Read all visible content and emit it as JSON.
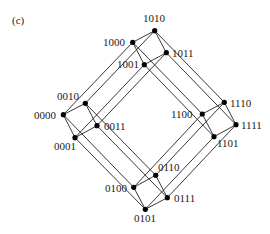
{
  "figure": {
    "panel_label": "(c)",
    "panel_label_pos": [
      12,
      24
    ],
    "node_radius": 2.6,
    "nodes": [
      {
        "id": "0000",
        "x": 63.3,
        "y": 114.7,
        "lx": 34,
        "ly": 119,
        "anchor": "start"
      },
      {
        "id": "0010",
        "x": 85.3,
        "y": 103.3,
        "lx": 57,
        "ly": 100,
        "anchor": "start"
      },
      {
        "id": "0001",
        "x": 75.0,
        "y": 137.7,
        "lx": 54,
        "ly": 150,
        "anchor": "start"
      },
      {
        "id": "0011",
        "x": 97.0,
        "y": 125.7,
        "lx": 104,
        "ly": 130,
        "anchor": "start"
      },
      {
        "id": "1000",
        "x": 132.7,
        "y": 42.3,
        "lx": 103,
        "ly": 46,
        "anchor": "start"
      },
      {
        "id": "1010",
        "x": 154.7,
        "y": 30.7,
        "lx": 143,
        "ly": 22,
        "anchor": "start"
      },
      {
        "id": "1001",
        "x": 144.3,
        "y": 64.7,
        "lx": 117,
        "ly": 68,
        "anchor": "start"
      },
      {
        "id": "1011",
        "x": 166.3,
        "y": 52.7,
        "lx": 172,
        "ly": 57,
        "anchor": "start"
      },
      {
        "id": "0100",
        "x": 133.7,
        "y": 187.3,
        "lx": 105,
        "ly": 192,
        "anchor": "start"
      },
      {
        "id": "0110",
        "x": 155.7,
        "y": 175.3,
        "lx": 158,
        "ly": 171,
        "anchor": "start"
      },
      {
        "id": "0101",
        "x": 145.3,
        "y": 209.3,
        "lx": 134,
        "ly": 222,
        "anchor": "start"
      },
      {
        "id": "0111",
        "x": 167.3,
        "y": 197.7,
        "lx": 174,
        "ly": 202,
        "anchor": "start"
      },
      {
        "id": "1100",
        "x": 202.3,
        "y": 114.0,
        "lx": 171,
        "ly": 118,
        "anchor": "start"
      },
      {
        "id": "1110",
        "x": 224.3,
        "y": 102.3,
        "lx": 230,
        "ly": 107,
        "anchor": "start"
      },
      {
        "id": "1101",
        "x": 214.0,
        "y": 136.7,
        "lx": 217,
        "ly": 147,
        "anchor": "start"
      },
      {
        "id": "1111",
        "x": 236.0,
        "y": 124.7,
        "lx": 241,
        "ly": 129,
        "anchor": "start"
      }
    ],
    "edges": [
      [
        "0000",
        "0010"
      ],
      [
        "0000",
        "0001"
      ],
      [
        "0010",
        "0011"
      ],
      [
        "0001",
        "0011"
      ],
      [
        "1000",
        "1010"
      ],
      [
        "1000",
        "1001"
      ],
      [
        "1010",
        "1011"
      ],
      [
        "1001",
        "1011"
      ],
      [
        "0100",
        "0110"
      ],
      [
        "0100",
        "0101"
      ],
      [
        "0110",
        "0111"
      ],
      [
        "0101",
        "0111"
      ],
      [
        "1100",
        "1110"
      ],
      [
        "1100",
        "1101"
      ],
      [
        "1110",
        "1111"
      ],
      [
        "1101",
        "1111"
      ],
      [
        "0000",
        "1000"
      ],
      [
        "0010",
        "1010"
      ],
      [
        "0001",
        "1001"
      ],
      [
        "0011",
        "1011"
      ],
      [
        "0100",
        "1100"
      ],
      [
        "0110",
        "1110"
      ],
      [
        "0101",
        "1101"
      ],
      [
        "0111",
        "1111"
      ],
      [
        "0000",
        "0100"
      ],
      [
        "0010",
        "0110"
      ],
      [
        "0001",
        "0101"
      ],
      [
        "0011",
        "0111"
      ],
      [
        "1000",
        "1100"
      ],
      [
        "1010",
        "1110"
      ],
      [
        "1001",
        "1101"
      ],
      [
        "1011",
        "1111"
      ]
    ]
  }
}
